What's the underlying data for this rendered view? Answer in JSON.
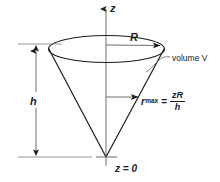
{
  "figure": {
    "name": "cone-volume-diagram",
    "background_color": "#ffffff",
    "stroke_color": "#1d1d1d",
    "labels": {
      "axis_z": "z",
      "radius_R": "R",
      "height_h": "h",
      "volume": "volume V",
      "origin": "z = 0"
    },
    "formula": {
      "symbol": "r",
      "subscript": "max",
      "equals": "=",
      "numerator": "zR",
      "denominator": "h"
    }
  },
  "geometry": {
    "axis": {
      "x": 106,
      "top_y": 8,
      "bottom_y": 166
    },
    "rim_ellipse": {
      "cx": 106.5,
      "cy": 49,
      "rx": 58,
      "ry": 13.5
    },
    "apex": {
      "x": 106,
      "y": 157
    },
    "height_dimension": {
      "x": 36,
      "top_y": 44,
      "bottom_y": 157
    },
    "radius_arrow": {
      "from_x": 106,
      "to_x": 164,
      "y": 45
    },
    "rmax_arrow": {
      "from_x": 106,
      "to_x": 142,
      "y": 97
    }
  }
}
